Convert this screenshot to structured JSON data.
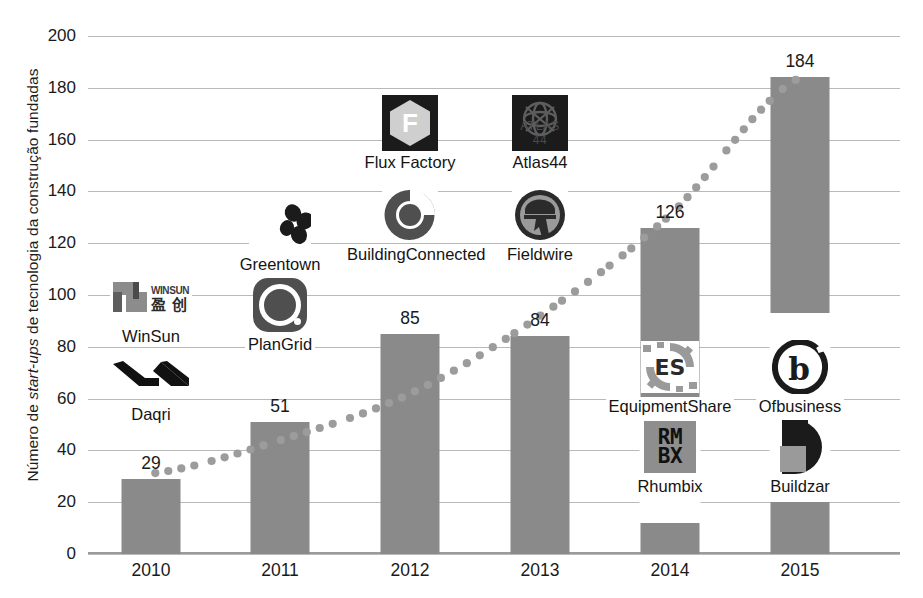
{
  "chart_data": {
    "type": "bar",
    "title": "",
    "xlabel": "",
    "ylabel": "Número de start-ups de tecnologia da construção fundadas",
    "ylabel_parts": {
      "pre": "Número de ",
      "italic": "start-ups",
      "post": " de tecnologia da construção fundadas"
    },
    "categories": [
      "2010",
      "2011",
      "2012",
      "2013",
      "2014",
      "2015"
    ],
    "values": [
      29,
      51,
      85,
      84,
      126,
      184
    ],
    "value_labels": [
      "29",
      "51",
      "85",
      "84",
      "126",
      "184"
    ],
    "ylim": [
      0,
      200
    ],
    "yticks": [
      0,
      20,
      40,
      60,
      80,
      100,
      120,
      140,
      160,
      180,
      200
    ],
    "ytick_labels": [
      "0",
      "20",
      "40",
      "60",
      "80",
      "100",
      "120",
      "140",
      "160",
      "180",
      "200"
    ],
    "grid": true,
    "legend": "none",
    "series": [
      {
        "name": "Número de start-ups fundadas",
        "type": "bar",
        "values": [
          29,
          51,
          85,
          84,
          126,
          184
        ]
      },
      {
        "name": "Tendência",
        "type": "line",
        "style": "dotted",
        "values": [
          31,
          44,
          62,
          92,
          131,
          184
        ]
      }
    ],
    "colors": {
      "bar": "#8a8a8a",
      "trend": "#9c9c9c",
      "grid": "#b9b9b9",
      "axis": "#9a9a9a",
      "text": "#1a1a1a"
    }
  },
  "annotations": {
    "logos": [
      {
        "year": "2010",
        "name": "WinSun",
        "icon": "winsun-logo-icon",
        "mark_text_en": "WINSUN",
        "mark_text_cn": "盈 创"
      },
      {
        "year": "2010",
        "name": "Daqri",
        "icon": "daqri-logo-icon"
      },
      {
        "year": "2011",
        "name": "Greentown",
        "icon": "greentown-logo-icon"
      },
      {
        "year": "2011",
        "name": "PlanGrid",
        "icon": "plangrid-logo-icon"
      },
      {
        "year": "2012",
        "name": "Flux Factory",
        "icon": "flux-factory-logo-icon",
        "mark_letter": "F"
      },
      {
        "year": "2012",
        "name": "BuildingConnected",
        "icon": "buildingconnected-logo-icon"
      },
      {
        "year": "2013",
        "name": "Atlas44",
        "icon": "atlas44-logo-icon",
        "mark_text": "ATLAS 44"
      },
      {
        "year": "2013",
        "name": "Fieldwire",
        "icon": "fieldwire-logo-icon"
      },
      {
        "year": "2014",
        "name": "EquipmentShare",
        "icon": "equipmentshare-logo-icon",
        "mark_letters": "ES"
      },
      {
        "year": "2014",
        "name": "Rhumbix",
        "icon": "rhumbix-logo-icon",
        "mark_line1": "RM",
        "mark_line2": "BX"
      },
      {
        "year": "2015",
        "name": "Ofbusiness",
        "icon": "ofbusiness-logo-icon",
        "mark_letter": "b"
      },
      {
        "year": "2015",
        "name": "Buildzar",
        "icon": "buildzar-logo-icon"
      }
    ]
  }
}
